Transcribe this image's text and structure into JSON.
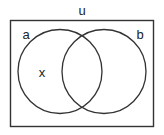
{
  "diagram": {
    "type": "venn",
    "universe": {
      "label": "u"
    },
    "sets": [
      {
        "label": "a"
      },
      {
        "label": "b"
      }
    ],
    "points": [
      {
        "label": "x",
        "region": "a only"
      }
    ],
    "colors": {
      "stroke": "#333333",
      "background": "#ffffff",
      "text": "#222222"
    }
  }
}
